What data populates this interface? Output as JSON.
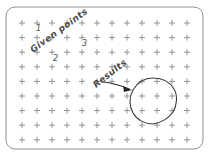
{
  "figure": {
    "background_color": "#ffffff",
    "frame": {
      "stroke_color": "#8f8f8f",
      "x": 6,
      "y": 7,
      "width": 197,
      "height": 142,
      "corner_radius": 9
    },
    "grid": {
      "marker": "plus",
      "marker_color": "#8a8a8a",
      "columns": 12,
      "rows": 9,
      "origin_x": 22,
      "origin_y": 23,
      "spacing_x": 15,
      "spacing_y": 14.6,
      "marker_size": 6
    },
    "labels": [
      {
        "id": "given-points",
        "text": "Given points",
        "x": 33,
        "y": 53,
        "rotation": -36,
        "color": "#4a4a4a",
        "font_size": 9
      },
      {
        "id": "results",
        "text": "Results",
        "x": 96,
        "y": 88,
        "rotation": -38,
        "color": "#4a4a4a",
        "font_size": 9
      }
    ],
    "point_numbers": [
      {
        "label": "1",
        "x": 36,
        "y": 31
      },
      {
        "label": "2",
        "x": 53,
        "y": 61
      },
      {
        "label": "3",
        "x": 82,
        "y": 46
      }
    ],
    "arrow": {
      "start_x": 104,
      "start_y": 82,
      "end_x": 131,
      "end_y": 90,
      "color": "#2b2b2b"
    },
    "result_circle": {
      "center_x": 153,
      "center_y": 101,
      "radius": 23,
      "stroke_color": "#3b3b3b",
      "style": "hand-drawn"
    }
  }
}
